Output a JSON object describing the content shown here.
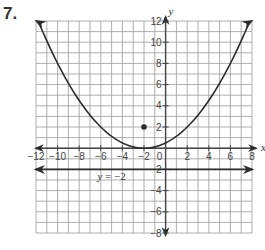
{
  "problem": {
    "number": "7."
  },
  "chart_data": {
    "type": "line",
    "title": "",
    "xlabel": "x",
    "ylabel": "y",
    "xlim": [
      -12,
      8
    ],
    "ylim": [
      -8,
      12
    ],
    "grid": true,
    "grid_step": 1,
    "x_ticks": [
      -12,
      -10,
      -8,
      -6,
      -4,
      -2,
      0,
      2,
      4,
      6,
      8
    ],
    "y_ticks": [
      -8,
      -6,
      -4,
      -2,
      2,
      4,
      6,
      8,
      10,
      12
    ],
    "x_tick_labels": [
      "−12",
      "−10",
      "−8",
      "−6",
      "−4",
      "−2",
      "0",
      "2",
      "4",
      "6",
      "8"
    ],
    "y_tick_labels": [
      "−8",
      "−6",
      "−4",
      "−2",
      "2",
      "4",
      "6",
      "8",
      "10",
      "12"
    ],
    "series": [
      {
        "name": "parabola",
        "equation": "y = (1/8)(x + 2)^2",
        "x": [
          -12,
          -10,
          -8,
          -6,
          -4,
          -2,
          0,
          2,
          4,
          6,
          8
        ],
        "values": [
          12.5,
          8,
          4.5,
          2,
          0.5,
          0,
          0.5,
          2,
          4.5,
          8,
          12.5
        ],
        "arrows_both_ends": true
      },
      {
        "name": "directrix",
        "equation": "y = -2",
        "x": [
          -12,
          8
        ],
        "values": [
          -2,
          -2
        ],
        "arrows_both_ends": true
      }
    ],
    "points": [
      {
        "name": "focus",
        "x": -2,
        "y": 2
      }
    ],
    "annotations": [
      {
        "text": "y = −2",
        "x": -5,
        "y": -2.6
      }
    ],
    "colors": {
      "grid": "#9a9a9a",
      "curve": "#2b2b2b",
      "axis": "#444444"
    }
  }
}
